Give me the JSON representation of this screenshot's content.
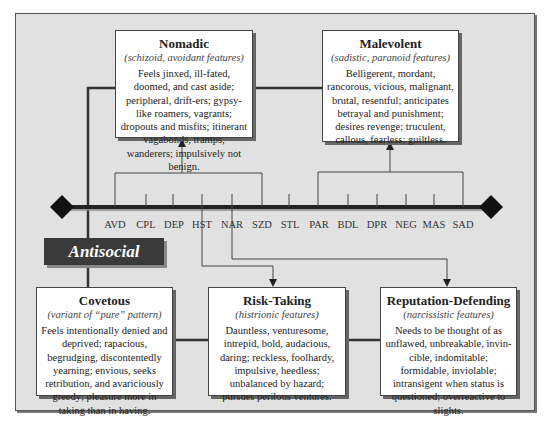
{
  "diagram": {
    "central_label": "Antisocial",
    "timeline": {
      "labels": [
        "AVD",
        "CPL",
        "DEP",
        "HST",
        "NAR",
        "SZD",
        "STL",
        "PAR",
        "BDL",
        "DPR",
        "NEG",
        "MAS",
        "SAD"
      ]
    },
    "boxes": {
      "nomadic": {
        "title": "Nomadic",
        "subtitle": "(schizoid, avoidant features)",
        "description": "Feels jinxed, ill-fated, doomed, and cast aside; peripheral, drift-ers; gypsy-like roamers, vagrants; dropouts and misfits; itinerant vagabonds, tramps, wanderers; impulsively not benign."
      },
      "malevolent": {
        "title": "Malevolent",
        "subtitle": "(sadistic, paranoid features)",
        "description": "Belligerent, mordant, rancorous, vicious, malignant, brutal, resentful; anticipates betrayal and punishment; desires revenge; truculent, callous, fearless; guiltless."
      },
      "covetous": {
        "title": "Covetous",
        "subtitle": "(variant of “pure” pattern)",
        "description": "Feels intentionally denied and deprived; rapacious, begrudging, discontentedly yearning; envious, seeks retribution, and avariciously greedy; pleasure more in taking than in having."
      },
      "risk_taking": {
        "title": "Risk-Taking",
        "subtitle": "(histrionic features)",
        "description": "Dauntless, venturesome, intrepid, bold, audacious, daring; reckless, foolhardy, impulsive, heedless; unbalanced by hazard; pursues perilous ventures."
      },
      "reputation_defending": {
        "title": "Reputation-Defending",
        "subtitle": "(narcissistic features)",
        "description": "Needs to be thought of as unflawed, unbreakable, invin-cible, indomitable; formidable, inviolable; intransigent when status is questioned; overreactive to slights."
      }
    },
    "colors": {
      "background": "#e1e1e1",
      "box_fill": "#ffffff",
      "label_fill": "#3a3a3a",
      "line": "#222222"
    }
  }
}
